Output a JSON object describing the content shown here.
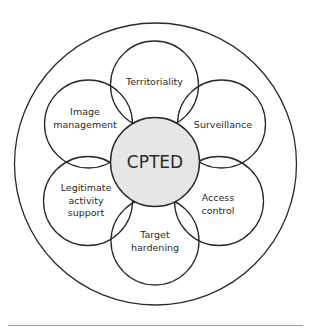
{
  "diagram": {
    "title": "CPTED",
    "colors": {
      "stroke": "#2a2a2a",
      "core_fill": "#e6e6e6",
      "background": "#ffffff",
      "rule": "#9a9a9a"
    },
    "outer_circle": {
      "cx": 155.5,
      "cy": 164,
      "r": 141
    },
    "core": {
      "label": "CPTED",
      "cx": 155,
      "cy": 162,
      "r": 44.5
    },
    "petals": [
      {
        "id": "territoriality",
        "lines": [
          "Territoriality"
        ],
        "cx": 154.5,
        "cy": 85,
        "r": 44,
        "lx": 154.5,
        "ly": 81
      },
      {
        "id": "surveillance",
        "lines": [
          "Surveillance"
        ],
        "cx": 221.5,
        "cy": 124,
        "r": 44,
        "lx": 223,
        "ly": 124
      },
      {
        "id": "access-control",
        "lines": [
          "Access",
          "control"
        ],
        "cx": 219,
        "cy": 201,
        "r": 44.5,
        "lx": 218,
        "ly": 204
      },
      {
        "id": "target-hardening",
        "lines": [
          "Target",
          "hardening"
        ],
        "cx": 155,
        "cy": 241,
        "r": 44,
        "lx": 155,
        "ly": 241
      },
      {
        "id": "legitimate-activity-support",
        "lines": [
          "Legitimate",
          "activity",
          "support"
        ],
        "cx": 88,
        "cy": 201,
        "r": 44.5,
        "lx": 86,
        "ly": 200
      },
      {
        "id": "image-management",
        "lines": [
          "Image",
          "management"
        ],
        "cx": 88.5,
        "cy": 124,
        "r": 44,
        "lx": 85,
        "ly": 118
      }
    ],
    "rule": {
      "x1": 8,
      "x2": 303,
      "y": 324.5
    }
  }
}
